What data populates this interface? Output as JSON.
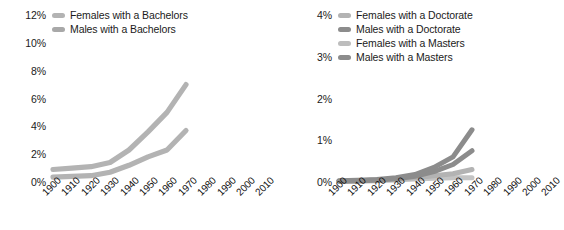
{
  "colors": {
    "light_gray": "#b3b3b3",
    "mid_gray": "#a8a8a8",
    "dark_gray": "#8c8c8c",
    "darker_gray": "#7d7d7d",
    "pale_gray": "#c4c4c4",
    "text": "#1a1a1a",
    "background": "#ffffff"
  },
  "charts": [
    {
      "name": "bachelors-chart",
      "chart_data": {
        "type": "line",
        "title": "",
        "xlabel": "",
        "ylabel": "",
        "xlim": [
          1900,
          2010
        ],
        "ylim": [
          0,
          12
        ],
        "grid": false,
        "legend_position": "top-left",
        "x": [
          1900,
          1910,
          1920,
          1930,
          1940,
          1950,
          1960,
          1970
        ],
        "categories": [
          "1900",
          "1910",
          "1920",
          "1930",
          "1940",
          "1950",
          "1960",
          "1970",
          "1980",
          "1990",
          "2000",
          "2010"
        ],
        "ytick_labels": [
          "0%",
          "2%",
          "4%",
          "6%",
          "8%",
          "10%",
          "12%"
        ],
        "ytick_values": [
          0,
          2,
          4,
          6,
          8,
          10,
          12
        ],
        "series": [
          {
            "name": "Females with a Bachelors",
            "color": "#b3b3b3",
            "values": [
              0.9,
              1.0,
              1.1,
              1.4,
              2.3,
              3.6,
              5.0,
              7.0
            ]
          },
          {
            "name": "Males with a Bachelors",
            "color": "#b3b3b3",
            "values": [
              0.35,
              0.4,
              0.45,
              0.7,
              1.2,
              1.8,
              2.3,
              3.7
            ]
          }
        ]
      },
      "legend": [
        {
          "label": "Females with a Bachelors",
          "color": "#b3b3b3"
        },
        {
          "label": "Males with a Bachelors",
          "color": "#a8a8a8"
        }
      ]
    },
    {
      "name": "advanced-degrees-chart",
      "chart_data": {
        "type": "line",
        "title": "",
        "xlabel": "",
        "ylabel": "",
        "xlim": [
          1900,
          2010
        ],
        "ylim": [
          0,
          4
        ],
        "grid": false,
        "legend_position": "top-left",
        "x": [
          1900,
          1910,
          1920,
          1930,
          1940,
          1950,
          1960,
          1970
        ],
        "categories": [
          "1900",
          "1910",
          "1920",
          "1930",
          "1940",
          "1950",
          "1960",
          "1970",
          "1980",
          "1990",
          "2000",
          "2010"
        ],
        "ytick_labels": [
          "0%",
          "1%",
          "2%",
          "3%",
          "4%"
        ],
        "ytick_values": [
          0,
          1,
          2,
          3,
          4
        ],
        "series": [
          {
            "name": "Females with a Doctorate",
            "color": "#c4c4c4",
            "values": [
              0.02,
              0.02,
              0.03,
              0.05,
              0.07,
              0.09,
              0.1,
              0.1
            ]
          },
          {
            "name": "Males with a Doctorate",
            "color": "#8c8c8c",
            "values": [
              0.03,
              0.04,
              0.06,
              0.1,
              0.18,
              0.35,
              0.6,
              1.25
            ]
          },
          {
            "name": "Females with a Masters",
            "color": "#b3b3b3",
            "values": [
              0.02,
              0.03,
              0.04,
              0.07,
              0.1,
              0.15,
              0.2,
              0.3
            ]
          },
          {
            "name": "Males with a Masters",
            "color": "#8c8c8c",
            "values": [
              0.02,
              0.03,
              0.05,
              0.08,
              0.14,
              0.25,
              0.42,
              0.75
            ]
          }
        ]
      },
      "legend": [
        {
          "label": "Females with a Doctorate",
          "color": "#b3b3b3"
        },
        {
          "label": "Males with a Doctorate",
          "color": "#8c8c8c"
        },
        {
          "label": "Females with a Masters",
          "color": "#bdbdbd"
        },
        {
          "label": "Males with a Masters",
          "color": "#8c8c8c"
        }
      ]
    }
  ]
}
